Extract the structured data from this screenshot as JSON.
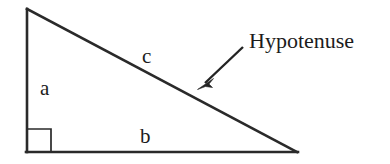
{
  "canvas": {
    "width": 390,
    "height": 164,
    "background_color": "#ffffff",
    "ink_color": "#2a2a2a"
  },
  "figure": {
    "type": "right-triangle-geometry-diagram"
  },
  "labels": {
    "leg_vertical": "a",
    "leg_horizontal": "b",
    "hypotenuse_short": "c",
    "callout": "Hypotenuse"
  },
  "geometry": {
    "apex": {
      "x": 27,
      "y": 9
    },
    "right_angle_vertex": {
      "x": 27,
      "y": 152
    },
    "base_right_vertex": {
      "x": 297,
      "y": 152
    },
    "right_angle_marker": {
      "x": 27,
      "y": 129,
      "size": 24
    },
    "arrow_tail": {
      "x": 243,
      "y": 47
    },
    "arrow_tip": {
      "x": 198,
      "y": 89
    }
  },
  "label_positions": {
    "a": {
      "x": 40,
      "y": 95
    },
    "b": {
      "x": 140,
      "y": 143
    },
    "c": {
      "x": 142,
      "y": 63
    },
    "callout": {
      "x": 249,
      "y": 48
    }
  }
}
